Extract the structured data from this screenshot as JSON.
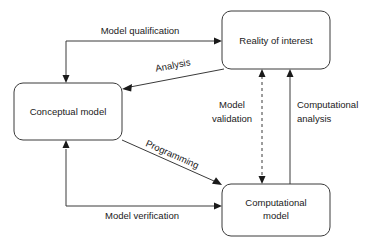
{
  "figure": {
    "background_color": "#ffffff",
    "stroke_color": "#3a3a3a",
    "text_color": "#1a1a1a"
  },
  "nodes": [
    {
      "id": "reality",
      "label": "Reality of interest",
      "line1": "Reality of interest",
      "line2": "",
      "x": 222,
      "y": 11,
      "w": 108,
      "h": 58,
      "rx": 9
    },
    {
      "id": "conceptual",
      "label": "Conceptual model",
      "line1": "Conceptual model",
      "line2": "",
      "x": 14,
      "y": 83,
      "w": 108,
      "h": 57,
      "rx": 9
    },
    {
      "id": "computational",
      "label": "Computational model",
      "line1": "Computational",
      "line2": "model",
      "x": 222,
      "y": 184,
      "w": 108,
      "h": 52,
      "rx": 9
    }
  ],
  "edges": [
    {
      "id": "model-qualification",
      "label": "Model qualification",
      "from": "reality",
      "to": "conceptual",
      "style": "solid",
      "arrows": "both-ends-separate",
      "label_x": 140,
      "label_y": 31,
      "label_anchor": "middle",
      "label_rotation": 0
    },
    {
      "id": "analysis",
      "label": "Analysis",
      "from": "reality",
      "to": "conceptual",
      "style": "solid",
      "arrows": "end",
      "label_x": 173,
      "label_y": 66,
      "label_anchor": "middle",
      "label_rotation": -21
    },
    {
      "id": "programming",
      "label": "Programming",
      "from": "conceptual",
      "to": "computational",
      "style": "solid",
      "arrows": "end",
      "label_x": 172,
      "label_y": 155,
      "label_anchor": "middle",
      "label_rotation": 23
    },
    {
      "id": "model-verification",
      "label": "Model verification",
      "from": "computational",
      "to": "conceptual",
      "style": "solid",
      "arrows": "both-ends-separate",
      "label_x": 142,
      "label_y": 216,
      "label_anchor": "middle",
      "label_rotation": 0
    },
    {
      "id": "model-validation",
      "label": "Model validation",
      "line1": "Model",
      "line2": "validation",
      "from": "reality",
      "to": "computational",
      "style": "dashed",
      "arrows": "both",
      "label_x": 232,
      "label_y": 105,
      "label_anchor": "middle",
      "label_rotation": 0
    },
    {
      "id": "computational-analysis",
      "label": "Computational analysis",
      "line1": "Computational",
      "line2": "analysis",
      "from": "computational",
      "to": "reality",
      "style": "solid",
      "arrows": "end",
      "label_x": 297,
      "label_y": 105,
      "label_anchor": "start",
      "label_rotation": 0
    }
  ]
}
